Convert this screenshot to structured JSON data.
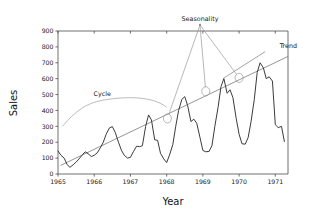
{
  "chart_data": {
    "type": "line",
    "title": "",
    "xlabel": "Year",
    "ylabel": "Sales",
    "xlim": [
      1965.0,
      1971.35
    ],
    "ylim": [
      0,
      900
    ],
    "grid": false,
    "legend": "none",
    "xticks": [
      "1965",
      "1966",
      "1967",
      "1968",
      "1969",
      "1970",
      "1971"
    ],
    "xtick_values": [
      1965,
      1966,
      1967,
      1968,
      1969,
      1970,
      1971
    ],
    "yticks": [
      "0",
      "100",
      "200",
      "300",
      "400",
      "500",
      "600",
      "700",
      "800",
      "900"
    ],
    "ytick_values": [
      0,
      100,
      200,
      300,
      400,
      500,
      600,
      700,
      800,
      900
    ],
    "series": [
      {
        "name": "Sales",
        "color": "#3b3b3b",
        "x": [
          1965.0,
          1965.08,
          1965.17,
          1965.25,
          1965.33,
          1965.42,
          1965.5,
          1965.58,
          1965.67,
          1965.75,
          1965.83,
          1965.92,
          1966.0,
          1966.08,
          1966.17,
          1966.25,
          1966.33,
          1966.42,
          1966.5,
          1966.58,
          1966.67,
          1966.75,
          1966.83,
          1966.92,
          1967.0,
          1967.08,
          1967.17,
          1967.25,
          1967.33,
          1967.42,
          1967.5,
          1967.58,
          1967.67,
          1967.75,
          1967.83,
          1967.92,
          1968.0,
          1968.08,
          1968.17,
          1968.25,
          1968.33,
          1968.42,
          1968.5,
          1968.58,
          1968.67,
          1968.75,
          1968.83,
          1968.92,
          1969.0,
          1969.08,
          1969.17,
          1969.25,
          1969.33,
          1969.42,
          1969.5,
          1969.58,
          1969.67,
          1969.75,
          1969.83,
          1969.92,
          1970.0,
          1970.08,
          1970.17,
          1970.25,
          1970.33,
          1970.42,
          1970.5,
          1970.58,
          1970.67,
          1970.75,
          1970.83,
          1970.92,
          1971.0,
          1971.08,
          1971.17,
          1971.25
        ],
        "values": [
          145,
          118,
          100,
          60,
          42,
          58,
          75,
          95,
          120,
          140,
          128,
          110,
          118,
          132,
          165,
          200,
          250,
          290,
          298,
          262,
          200,
          150,
          118,
          100,
          105,
          140,
          175,
          172,
          178,
          300,
          372,
          340,
          215,
          212,
          130,
          95,
          72,
          120,
          185,
          300,
          400,
          470,
          487,
          430,
          330,
          345,
          320,
          230,
          148,
          140,
          142,
          178,
          300,
          420,
          550,
          600,
          508,
          530,
          480,
          350,
          250,
          190,
          188,
          230,
          330,
          470,
          640,
          700,
          668,
          600,
          612,
          585,
          310,
          292,
          300,
          205
        ]
      },
      {
        "name": "Trend",
        "color": "#8a8a8a",
        "x": [
          1965.08,
          1971.35
        ],
        "values": [
          55,
          740
        ]
      }
    ],
    "annotations": [
      {
        "name": "trend",
        "label": "Trend",
        "label_x": 1971.12,
        "label_y": 790,
        "leader_from_x": 1970.72,
        "leader_from_y": 770,
        "leader_to_x": 1969.55,
        "leader_to_y": 600
      },
      {
        "name": "seasonality",
        "label": "Seasonality",
        "label_x": 1968.92,
        "label_y": 960,
        "targets": [
          {
            "x": 1968.02,
            "y": 350
          },
          {
            "x": 1969.08,
            "y": 520
          },
          {
            "x": 1970.0,
            "y": 605
          }
        ]
      },
      {
        "name": "cycle",
        "label": "Cycle",
        "label_x": 1966.22,
        "label_y": 492,
        "bracket_from_x": 1965.12,
        "bracket_from_y": 300,
        "bracket_to_x": 1968.0,
        "bracket_to_y": 420
      }
    ]
  }
}
